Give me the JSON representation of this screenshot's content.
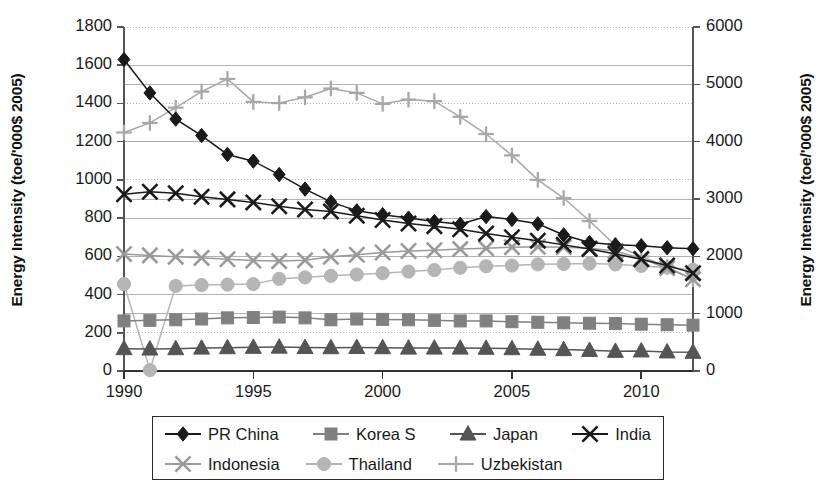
{
  "chart_data": {
    "type": "line",
    "title": "",
    "xlabel": "",
    "ylabel": "Energy Intensity (toe/'000$ 2005)",
    "ylabel_right": "Energy Intensity (toe/'000$ 2005)",
    "grid": true,
    "legend_position": "bottom",
    "xlim": [
      1990,
      2012
    ],
    "xticks": [
      1990,
      1995,
      2000,
      2005,
      2010
    ],
    "xtick_labels": [
      "1990",
      "1995",
      "2000",
      "2005",
      "2010"
    ],
    "ylim": [
      0,
      1800
    ],
    "yticks": [
      0,
      200,
      400,
      600,
      800,
      1000,
      1200,
      1400,
      1600,
      1800
    ],
    "ytick_labels": [
      "0",
      "200",
      "400",
      "600",
      "800",
      "1000",
      "1200",
      "1400",
      "1600",
      "1800"
    ],
    "ylim_right": [
      0,
      6000
    ],
    "yticks_right": [
      0,
      1000,
      2000,
      3000,
      4000,
      5000,
      6000
    ],
    "ytick_labels_right": [
      "0",
      "1000",
      "2000",
      "3000",
      "4000",
      "5000",
      "6000"
    ],
    "x": [
      1990,
      1991,
      1992,
      1993,
      1994,
      1995,
      1996,
      1997,
      1998,
      1999,
      2000,
      2001,
      2002,
      2003,
      2004,
      2005,
      2006,
      2007,
      2008,
      2009,
      2010,
      2011,
      2012
    ],
    "series": [
      {
        "name": "PR China",
        "marker": "diamond",
        "color": "#1a1a1a",
        "axis": "left",
        "values": [
          1630,
          1455,
          1318,
          1232,
          1133,
          1098,
          1028,
          952,
          885,
          838,
          818,
          800,
          782,
          768,
          808,
          793,
          770,
          712,
          672,
          660,
          655,
          645,
          640
        ]
      },
      {
        "name": "Korea S",
        "marker": "square",
        "color": "#808080",
        "axis": "left",
        "values": [
          262,
          265,
          268,
          272,
          278,
          280,
          282,
          278,
          268,
          272,
          270,
          268,
          265,
          262,
          262,
          258,
          255,
          252,
          250,
          248,
          245,
          242,
          240
        ]
      },
      {
        "name": "Japan",
        "marker": "triangle",
        "color": "#555555",
        "axis": "left",
        "values": [
          117,
          115,
          117,
          120,
          122,
          124,
          125,
          123,
          122,
          123,
          122,
          120,
          120,
          120,
          119,
          117,
          114,
          112,
          108,
          103,
          105,
          100,
          98
        ]
      },
      {
        "name": "India",
        "marker": "x",
        "color": "#1a1a1a",
        "axis": "left",
        "values": [
          925,
          938,
          930,
          912,
          898,
          882,
          862,
          845,
          835,
          812,
          790,
          772,
          758,
          742,
          720,
          700,
          682,
          660,
          638,
          612,
          585,
          552,
          512
        ]
      },
      {
        "name": "Indonesia",
        "marker": "x",
        "color": "#9a9a9a",
        "axis": "left",
        "values": [
          612,
          605,
          598,
          592,
          585,
          578,
          575,
          580,
          598,
          608,
          620,
          628,
          632,
          638,
          642,
          648,
          650,
          648,
          642,
          628,
          588,
          538,
          480
        ]
      },
      {
        "name": "Thailand",
        "marker": "circle",
        "color": "#b5b5b5",
        "axis": "left",
        "values": [
          455,
          5,
          445,
          450,
          452,
          455,
          482,
          490,
          498,
          505,
          512,
          520,
          528,
          540,
          548,
          552,
          558,
          560,
          562,
          558,
          550,
          542,
          530
        ]
      },
      {
        "name": "Uzbekistan",
        "marker": "plus",
        "color": "#a8a8a8",
        "axis": "left",
        "values": [
          1248,
          1298,
          1378,
          1462,
          1528,
          1408,
          1402,
          1432,
          1478,
          1455,
          1398,
          1420,
          1412,
          1330,
          1240,
          1128,
          1000,
          905,
          785,
          658,
          600,
          545,
          480
        ]
      }
    ]
  },
  "legend": {
    "entries": [
      {
        "label": "PR China",
        "marker": "diamond",
        "color": "#1a1a1a"
      },
      {
        "label": "Korea S",
        "marker": "square",
        "color": "#808080"
      },
      {
        "label": "Japan",
        "marker": "triangle",
        "color": "#555555"
      },
      {
        "label": "India",
        "marker": "x",
        "color": "#1a1a1a"
      },
      {
        "label": "Indonesia",
        "marker": "x",
        "color": "#9a9a9a"
      },
      {
        "label": "Thailand",
        "marker": "circle",
        "color": "#b5b5b5"
      },
      {
        "label": "Uzbekistan",
        "marker": "plus",
        "color": "#a8a8a8"
      }
    ]
  },
  "style": {
    "axis_color": "#555555",
    "grid_color": "#aaaaaa",
    "background": "#ffffff"
  }
}
